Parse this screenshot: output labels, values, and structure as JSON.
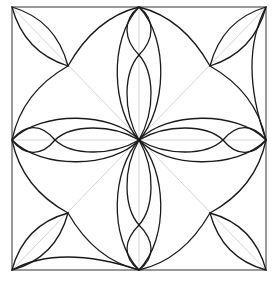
{
  "diagram": {
    "title": "",
    "colors": {
      "frame": "#555555",
      "guides": "#d4d4d4",
      "curves": "#1a1a1a",
      "background": "#ffffff"
    },
    "square": {
      "x1": 12,
      "y1": 7,
      "x2": 266,
      "y2": 270
    },
    "center": {
      "x": 139,
      "y": 140
    },
    "cusps": [
      {
        "name": "top-left",
        "x": 68,
        "y": 66
      },
      {
        "name": "top-right",
        "x": 210,
        "y": 66
      },
      {
        "name": "bottom-right",
        "x": 210,
        "y": 213
      },
      {
        "name": "bottom-left",
        "x": 68,
        "y": 213
      }
    ],
    "side_midpoints": [
      {
        "name": "top",
        "x": 139,
        "y": 7
      },
      {
        "name": "right",
        "x": 266,
        "y": 140
      },
      {
        "name": "bottom",
        "x": 139,
        "y": 270
      },
      {
        "name": "left",
        "x": 12,
        "y": 140
      }
    ]
  }
}
